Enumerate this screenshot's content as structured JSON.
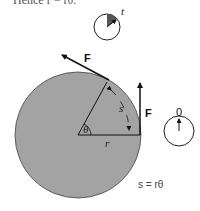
{
  "caption": "Hence r = rθ.",
  "labels": {
    "clock_t": "t",
    "clock_zero": "0",
    "force_tangent": "F",
    "force_vertical": "F",
    "arc": "s",
    "angle": "θ",
    "radius": "r",
    "equation": "s = rθ"
  },
  "colors": {
    "disk_fill": "#a3a3a3",
    "stroke": "#1a1a1a",
    "clock_wedge": "#555555"
  }
}
